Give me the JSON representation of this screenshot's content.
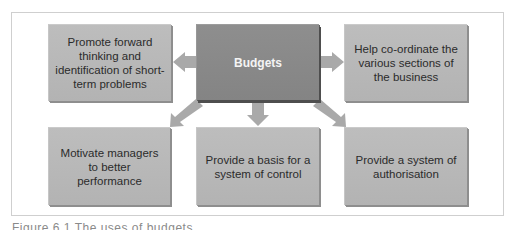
{
  "diagram": {
    "center": {
      "label": "Budgets"
    },
    "nodes": [
      {
        "id": "top-left",
        "label": "Promote forward thinking and identification of short-term problems"
      },
      {
        "id": "top-right",
        "label": "Help co-ordinate the various sections of the business"
      },
      {
        "id": "bottom-left",
        "label": "Motivate managers to better performance"
      },
      {
        "id": "bottom-middle",
        "label": "Provide a basis for a system of control"
      },
      {
        "id": "bottom-right",
        "label": "Provide a system of authorisation"
      }
    ],
    "edges": [
      {
        "from": "center",
        "to": "top-left"
      },
      {
        "from": "center",
        "to": "top-right"
      },
      {
        "from": "center",
        "to": "bottom-left"
      },
      {
        "from": "center",
        "to": "bottom-middle"
      },
      {
        "from": "center",
        "to": "bottom-right"
      }
    ],
    "colors": {
      "center_box": "#898989",
      "outer_box": "#b8b8b8",
      "arrow": "#a9a9a9",
      "frame": "#cfcfcf"
    }
  },
  "caption": {
    "text": "Figure 6.1 The uses of budgets"
  }
}
